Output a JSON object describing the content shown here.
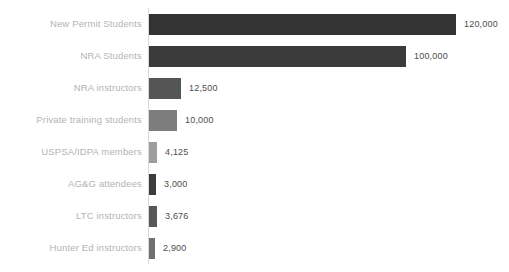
{
  "chart_data": {
    "type": "bar",
    "orientation": "horizontal",
    "title": "",
    "subtitle": "",
    "xlabel": "",
    "ylabel": "",
    "xlim": [
      0,
      120000
    ],
    "grid": false,
    "legend": null,
    "categories": [
      "New Permit Students",
      "NRA Students",
      "NRA instructors",
      "Private training students",
      "USPSA/IDPA members",
      "AG&G attendees",
      "LTC instructors",
      "Hunter Ed instructors"
    ],
    "values": [
      120000,
      100000,
      12500,
      10000,
      4125,
      3000,
      3676,
      2900
    ],
    "value_labels": [
      "120,000",
      "100,000",
      "12,500",
      "10,000",
      "4,125",
      "3,000",
      "3,676",
      "2,900"
    ],
    "bar_colors": [
      "#333333",
      "#3b3b3b",
      "#555555",
      "#7d7d7d",
      "#9e9e9e",
      "#3c3c3c",
      "#575757",
      "#707070"
    ],
    "bars": [
      {
        "category": "New Permit Students",
        "value": 120000,
        "label": "120,000",
        "color": "#333333",
        "px_width": 307
      },
      {
        "category": "NRA Students",
        "value": 100000,
        "label": "100,000",
        "color": "#3b3b3b",
        "px_width": 257
      },
      {
        "category": "NRA instructors",
        "value": 12500,
        "label": "12,500",
        "color": "#555555",
        "px_width": 32
      },
      {
        "category": "Private training students",
        "value": 10000,
        "label": "10,000",
        "color": "#7d7d7d",
        "px_width": 28
      },
      {
        "category": "USPSA/IDPA members",
        "value": 4125,
        "label": "4,125",
        "color": "#9e9e9e",
        "px_width": 8
      },
      {
        "category": "AG&G attendees",
        "value": 3000,
        "label": "3,000",
        "color": "#3c3c3c",
        "px_width": 7
      },
      {
        "category": "LTC instructors",
        "value": 3676,
        "label": "3,676",
        "color": "#575757",
        "px_width": 8
      },
      {
        "category": "Hunter Ed instructors",
        "value": 2900,
        "label": "2,900",
        "color": "#707070",
        "px_width": 6
      }
    ]
  },
  "style": {
    "background": "#ffffff",
    "axis_color": "#d8d8d8",
    "category_label_color": "#b3b3b3",
    "value_label_color": "#4d4d4d"
  }
}
